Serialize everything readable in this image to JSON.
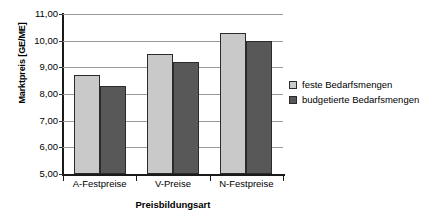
{
  "chart_data": {
    "type": "bar",
    "title": "",
    "xlabel": "Preisbildungsart",
    "ylabel": "Marktpreis [GE/ME]",
    "categories": [
      "A-Festpreise",
      "V-Preise",
      "N-Festpreise"
    ],
    "series": [
      {
        "name": "feste Bedarfsmengen",
        "values": [
          8.7,
          9.5,
          10.3
        ],
        "color": "#c9c9c9"
      },
      {
        "name": "budgetierte Bedarfsmengen",
        "values": [
          8.3,
          9.2,
          10.0
        ],
        "color": "#585858"
      }
    ],
    "ylim": [
      5.0,
      11.0
    ],
    "yticks": [
      5.0,
      6.0,
      7.0,
      8.0,
      9.0,
      10.0,
      11.0
    ],
    "ytick_labels": [
      "5,00",
      "6,00",
      "7,00",
      "8,00",
      "9,00",
      "10,00",
      "11,00"
    ],
    "grid": true,
    "legend_position": "right"
  }
}
